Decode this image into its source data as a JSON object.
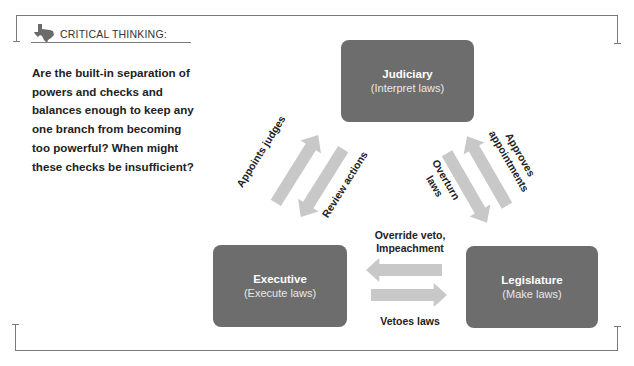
{
  "critical_thinking": {
    "header": "CRITICAL THINKING:",
    "icon": "texas-icon",
    "question": "Are the built-in separation of powers and checks and balances enough to keep any one branch from becoming too powerful? When might these checks be insufficient?"
  },
  "diagram": {
    "branches": {
      "judiciary": {
        "name": "Judiciary",
        "role": "(Interpret laws)"
      },
      "executive": {
        "name": "Executive",
        "role": "(Execute laws)"
      },
      "legislature": {
        "name": "Legislature",
        "role": "(Make laws)"
      }
    },
    "relations": {
      "appoints_judges": "Appoints judges",
      "review_actions": "Review actions",
      "overturn_laws_1": "Overturn",
      "overturn_laws_2": "laws",
      "approves_appointments_1": "Approves",
      "approves_appointments_2": "appointments",
      "override_veto_1": "Override veto,",
      "override_veto_2": "Impeachment",
      "vetoes_laws": "Vetoes laws"
    },
    "colors": {
      "box": "#6d6d6d",
      "arrow": "#c8c8c8",
      "frame": "#7a7a7a"
    }
  }
}
